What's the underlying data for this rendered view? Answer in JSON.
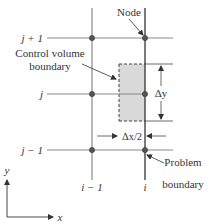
{
  "diagram": {
    "title": "",
    "rows": {
      "j_plus_1": {
        "label": "j + 1",
        "y": 38
      },
      "j": {
        "label": "j",
        "y": 94
      },
      "j_minus_1": {
        "label": "j − 1",
        "y": 150
      }
    },
    "columns": {
      "i_minus_1": {
        "label": "i − 1",
        "x": 92
      },
      "i": {
        "label": "i",
        "x": 145
      }
    },
    "annotations": {
      "node": "Node",
      "control_volume_line1": "Control volume",
      "control_volume_line2": "boundary",
      "problem_line1": "Problem",
      "problem_line2": "boundary",
      "delta_y": "Δy",
      "delta_x_half": "Δx/2"
    },
    "axes": {
      "x_label": "x",
      "y_label": "y"
    },
    "colors": {
      "grid_line": "#8a8a8a",
      "boundary_line": "#333333",
      "control_volume_fill": "#d9d9d9",
      "node_fill": "#555555",
      "text": "#333333"
    }
  }
}
